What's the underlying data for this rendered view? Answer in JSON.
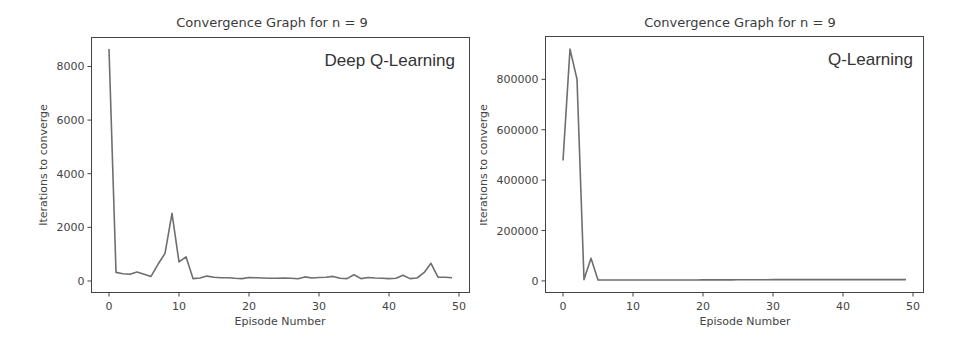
{
  "chart_data": [
    {
      "type": "line",
      "title": "Convergence Graph for n = 9",
      "annotation": "Deep Q-Learning",
      "xlabel": "Episode Number",
      "ylabel": "Iterations to converge",
      "xticks": [
        0,
        10,
        20,
        30,
        40,
        50
      ],
      "yticks": [
        0,
        2000,
        4000,
        6000,
        8000
      ],
      "xlim": [
        -2.5,
        51.5
      ],
      "ylim": [
        -430,
        9080
      ],
      "grid": false,
      "legend": null,
      "series": [
        {
          "name": "Deep Q-Learning",
          "color": "#6e6e6e",
          "x": [
            0,
            1,
            2,
            3,
            4,
            5,
            6,
            7,
            8,
            9,
            10,
            11,
            12,
            13,
            14,
            15,
            16,
            17,
            18,
            19,
            20,
            21,
            22,
            23,
            24,
            25,
            26,
            27,
            28,
            29,
            30,
            31,
            32,
            33,
            34,
            35,
            36,
            37,
            38,
            39,
            40,
            41,
            42,
            43,
            44,
            45,
            46,
            47,
            48,
            49
          ],
          "values": [
            8650,
            320,
            270,
            250,
            330,
            250,
            170,
            620,
            1030,
            2520,
            710,
            900,
            90,
            110,
            180,
            140,
            120,
            120,
            100,
            90,
            130,
            120,
            110,
            100,
            100,
            110,
            100,
            80,
            150,
            110,
            130,
            140,
            170,
            100,
            90,
            230,
            90,
            130,
            110,
            100,
            90,
            100,
            210,
            90,
            110,
            310,
            660,
            140,
            140,
            120
          ]
        }
      ]
    },
    {
      "type": "line",
      "title": "Convergence Graph for n = 9",
      "annotation": "Q-Learning",
      "xlabel": "Episode Number",
      "ylabel": "Iterations to converge",
      "xticks": [
        0,
        10,
        20,
        30,
        40,
        50
      ],
      "yticks": [
        0,
        200000,
        400000,
        600000,
        800000
      ],
      "xlim": [
        -2.5,
        51.5
      ],
      "ylim": [
        -46000,
        970000
      ],
      "grid": false,
      "legend": null,
      "series": [
        {
          "name": "Q-Learning",
          "color": "#6e6e6e",
          "x": [
            0,
            1,
            2,
            3,
            4,
            5,
            6,
            7,
            8,
            9,
            10,
            11,
            12,
            13,
            14,
            15,
            16,
            17,
            18,
            19,
            20,
            21,
            22,
            23,
            24,
            25,
            26,
            27,
            28,
            29,
            30,
            31,
            32,
            33,
            34,
            35,
            36,
            37,
            38,
            39,
            40,
            41,
            42,
            43,
            44,
            45,
            46,
            47,
            48,
            49
          ],
          "values": [
            478000,
            920000,
            800000,
            5000,
            90000,
            4000,
            3500,
            3500,
            3500,
            3500,
            3500,
            3500,
            3500,
            3500,
            3500,
            3500,
            3500,
            3500,
            3500,
            3500,
            4000,
            4000,
            4000,
            4000,
            4000,
            4500,
            4500,
            4500,
            4500,
            4500,
            5000,
            5000,
            5000,
            5000,
            5000,
            5000,
            5000,
            5000,
            5000,
            5000,
            5000,
            5000,
            5000,
            5000,
            5000,
            5000,
            5000,
            5000,
            5000,
            5000
          ]
        }
      ]
    }
  ],
  "charts": [
    {
      "title": "Convergence Graph for n = 9",
      "annotation": "Deep Q-Learning",
      "xlabel": "Episode Number",
      "ylabel": "Iterations to converge"
    },
    {
      "title": "Convergence Graph for n = 9",
      "annotation": "Q-Learning",
      "xlabel": "Episode Number",
      "ylabel": "Iterations to converge"
    }
  ]
}
